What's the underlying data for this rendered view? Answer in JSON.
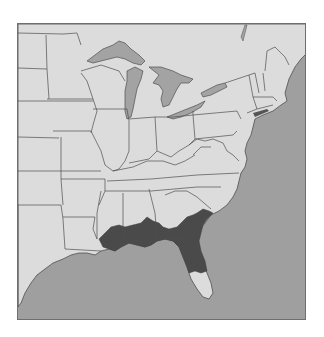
{
  "map": {
    "region": "Eastern United States",
    "type": "species range map",
    "legend": [],
    "colors": {
      "land": "#dcdcdc",
      "water": "#9f9f9f",
      "lakes": "#a3a3a3",
      "range": "#4a4a4a",
      "borders": "#4f4f4f",
      "background": "#ffffff"
    },
    "highlighted_range": {
      "description": "Gulf Coastal Plain from southeastern Louisiana east through southern Mississippi, southern Alabama, southern Georgia, coastal South Carolina, and northern/central Florida"
    }
  }
}
